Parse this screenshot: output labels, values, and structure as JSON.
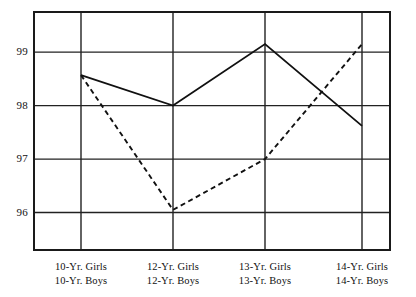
{
  "chart_data": {
    "type": "line",
    "title": "",
    "subtitle": "",
    "xlabel": "",
    "ylabel": "",
    "categories": [
      "10-Yr.",
      "12-Yr.",
      "13-Yr.",
      "14-Yr."
    ],
    "category_labels": [
      {
        "girls": "10-Yr.  Girls",
        "boys": "10-Yr.  Boys"
      },
      {
        "girls": "12-Yr.  Girls",
        "boys": "12-Yr.  Boys"
      },
      {
        "girls": "13-Yr.  Girls",
        "boys": "13-Yr.  Boys"
      },
      {
        "girls": "14-Yr.  Girls",
        "boys": "14-Yr.  Boys"
      }
    ],
    "series": [
      {
        "name": "Girls",
        "style": "solid",
        "values": [
          98.57,
          98.0,
          99.15,
          97.62
        ]
      },
      {
        "name": "Boys",
        "style": "dashed",
        "values": [
          98.57,
          96.05,
          97.0,
          99.15
        ]
      }
    ],
    "ylim": [
      95.3,
      99.75
    ],
    "yticks": [
      99,
      98,
      97,
      96
    ],
    "ytick_labels": [
      "99",
      "98",
      "97",
      "96"
    ],
    "grid": true,
    "grid_horizontal": true,
    "grid_vertical": true,
    "legend": "none",
    "legend_position": "none",
    "colors": {
      "axis": "#1a1a1a",
      "grid": "#222222",
      "series_girls": "#111111",
      "series_boys": "#111111",
      "background": "#ffffff"
    }
  }
}
